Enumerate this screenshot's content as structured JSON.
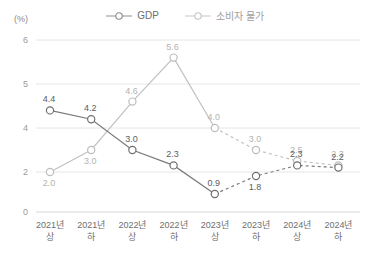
{
  "axis": {
    "unit_label": "(%)",
    "y_ticks": [
      "6",
      "5",
      "4",
      "2",
      "0"
    ],
    "y_tick_values": [
      6,
      5,
      4,
      2,
      0
    ]
  },
  "legend": {
    "position": "top-center",
    "items": [
      {
        "label": "GDP",
        "color": "#7a7a7a",
        "marker": "open-circle"
      },
      {
        "label": "소비자 물가",
        "color": "#c2c2c2",
        "marker": "open-circle"
      }
    ]
  },
  "chart_data": {
    "type": "line",
    "title": "",
    "subtitle": "",
    "xlabel": "",
    "ylabel": "(%)",
    "ylim": [
      0,
      6
    ],
    "grid": true,
    "legend_position": "top-center",
    "categories": [
      "2021년\n상",
      "2021년\n하",
      "2022년\n상",
      "2022년\n하",
      "2023년\n상",
      "2023년\n하",
      "2024년\n상",
      "2024년\n하"
    ],
    "category_lines": [
      [
        "2021년",
        "상"
      ],
      [
        "2021년",
        "하"
      ],
      [
        "2022년",
        "상"
      ],
      [
        "2022년",
        "하"
      ],
      [
        "2023년",
        "상"
      ],
      [
        "2023년",
        "하"
      ],
      [
        "2024년",
        "상"
      ],
      [
        "2024년",
        "하"
      ]
    ],
    "series": [
      {
        "name": "GDP",
        "color": "#7a7a7a",
        "values": [
          4.4,
          4.2,
          3.0,
          2.3,
          0.9,
          1.8,
          2.3,
          2.2
        ],
        "labels": [
          "4.4",
          "4.2",
          "3.0",
          "2.3",
          "0.9",
          "1.8",
          "2.3",
          "2.2"
        ],
        "solid_until_index": 4,
        "dashed_from_index": 4
      },
      {
        "name": "소비자 물가",
        "color": "#c2c2c2",
        "values": [
          2.0,
          3.0,
          4.6,
          5.6,
          4.0,
          3.0,
          2.5,
          2.3
        ],
        "labels": [
          "2.0",
          "3.0",
          "4.6",
          "5.6",
          "4.0",
          "3.0",
          "2.5",
          "2.3"
        ],
        "solid_until_index": 4,
        "dashed_from_index": 4
      }
    ]
  }
}
